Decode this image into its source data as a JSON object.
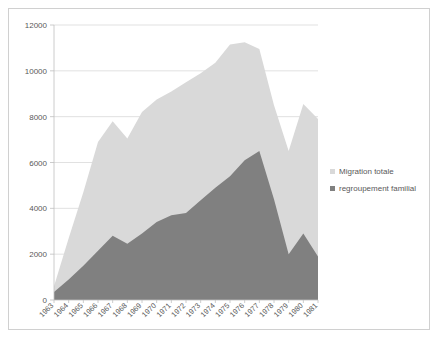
{
  "chart_data": {
    "type": "area",
    "title": "",
    "subtitle": "",
    "xlabel": "",
    "ylabel": "",
    "categories": [
      "1963",
      "1964",
      "1965",
      "1966",
      "1967",
      "1968",
      "1969",
      "1970",
      "1971",
      "1972",
      "1973",
      "1974",
      "1975",
      "1976",
      "1977",
      "1978",
      "1979",
      "1980",
      "1981"
    ],
    "series": [
      {
        "name": "Migration totale",
        "color": "#d9d9d9",
        "values": [
          600,
          2700,
          4700,
          6900,
          7800,
          7050,
          8200,
          8750,
          9100,
          9500,
          9900,
          10350,
          11150,
          11250,
          10950,
          8500,
          6500,
          8550,
          7900
        ]
      },
      {
        "name": "regroupement familial",
        "color": "#808080",
        "values": [
          350,
          900,
          1500,
          2150,
          2800,
          2450,
          2900,
          3400,
          3700,
          3800,
          4350,
          4900,
          5400,
          6100,
          6500,
          4400,
          2000,
          2900,
          1900
        ]
      }
    ],
    "ylim": [
      0,
      12000
    ],
    "yticks": [
      "0",
      "2000",
      "4000",
      "6000",
      "8000",
      "10000",
      "12000"
    ],
    "ytick_values": [
      0,
      2000,
      4000,
      6000,
      8000,
      10000,
      12000
    ],
    "grid": true,
    "legend_position": "right"
  },
  "legend": {
    "items": [
      {
        "label": "Migration totale",
        "color": "#d9d9d9"
      },
      {
        "label": "regroupement familial",
        "color": "#808080"
      }
    ]
  }
}
